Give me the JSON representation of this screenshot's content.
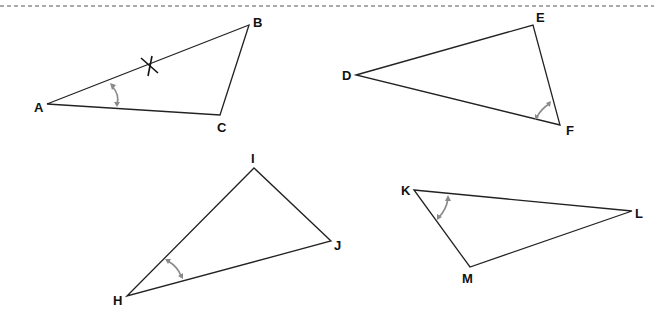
{
  "header": {
    "note_text": "NOTE: Not drawn to scale",
    "separator": "dashed-line"
  },
  "colors": {
    "edge": "#222222",
    "angle_marker": "#8a8a8a",
    "label": "#111111"
  },
  "triangles": [
    {
      "name": "ABC",
      "vertices": [
        {
          "label": "A",
          "x": 47,
          "y": 104,
          "lx": 34,
          "ly": 112
        },
        {
          "label": "B",
          "x": 249,
          "y": 25,
          "lx": 253,
          "ly": 27
        },
        {
          "label": "C",
          "x": 220,
          "y": 115,
          "lx": 217,
          "ly": 132
        }
      ],
      "markers": [
        "tick-mark on AB",
        "angle-arc at A"
      ]
    },
    {
      "name": "DEF",
      "vertices": [
        {
          "label": "D",
          "x": 356,
          "y": 75,
          "lx": 342,
          "ly": 80
        },
        {
          "label": "E",
          "x": 533,
          "y": 25,
          "lx": 536,
          "ly": 22
        },
        {
          "label": "F",
          "x": 560,
          "y": 125,
          "lx": 566,
          "ly": 135
        }
      ],
      "markers": [
        "angle-arc at F"
      ]
    },
    {
      "name": "HIJ",
      "vertices": [
        {
          "label": "H",
          "x": 127,
          "y": 296,
          "lx": 113,
          "ly": 305
        },
        {
          "label": "I",
          "x": 254,
          "y": 168,
          "lx": 251,
          "ly": 163
        },
        {
          "label": "J",
          "x": 331,
          "y": 241,
          "lx": 334,
          "ly": 250
        }
      ],
      "markers": [
        "angle-arc at H"
      ]
    },
    {
      "name": "KLM",
      "vertices": [
        {
          "label": "K",
          "x": 414,
          "y": 190,
          "lx": 401,
          "ly": 195
        },
        {
          "label": "L",
          "x": 632,
          "y": 211,
          "lx": 635,
          "ly": 218
        },
        {
          "label": "M",
          "x": 470,
          "y": 267,
          "lx": 462,
          "ly": 283
        }
      ],
      "markers": [
        "angle-arc at K"
      ]
    }
  ]
}
